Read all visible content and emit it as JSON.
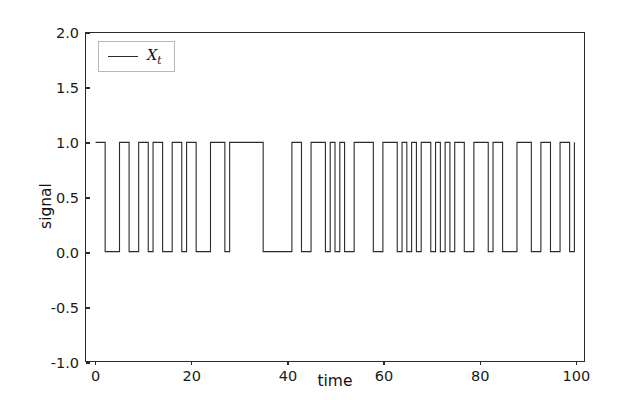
{
  "chart_data": {
    "type": "line",
    "title": "",
    "xlabel": "time",
    "ylabel": "signal",
    "xlim": [
      -2,
      102
    ],
    "ylim": [
      -1.0,
      2.0
    ],
    "grid": false,
    "legend_position": "upper left",
    "xticks": [
      0,
      20,
      40,
      60,
      80,
      100
    ],
    "xtick_labels": [
      "0",
      "20",
      "40",
      "60",
      "80",
      "100"
    ],
    "yticks": [
      -1.0,
      -0.5,
      0.0,
      0.5,
      1.0,
      1.5,
      2.0
    ],
    "ytick_labels": [
      "-1.0",
      "-0.5",
      "0.0",
      "0.5",
      "1.0",
      "1.5",
      "2.0"
    ],
    "series": [
      {
        "name": "X_t",
        "legend_label": "X",
        "legend_subscript": "t",
        "color": "#2b2b2b",
        "linewidth": 1.2,
        "drawstyle": "steps-post",
        "x": [
          0,
          1,
          2,
          3,
          4,
          5,
          6,
          7,
          8,
          9,
          10,
          11,
          12,
          13,
          14,
          15,
          16,
          17,
          18,
          19,
          20,
          21,
          22,
          23,
          24,
          25,
          26,
          27,
          28,
          29,
          30,
          31,
          32,
          33,
          34,
          35,
          36,
          37,
          38,
          39,
          40,
          41,
          42,
          43,
          44,
          45,
          46,
          47,
          48,
          49,
          50,
          51,
          52,
          53,
          54,
          55,
          56,
          57,
          58,
          59,
          60,
          61,
          62,
          63,
          64,
          65,
          66,
          67,
          68,
          69,
          70,
          71,
          72,
          73,
          74,
          75,
          76,
          77,
          78,
          79,
          80,
          81,
          82,
          83,
          84,
          85,
          86,
          87,
          88,
          89,
          90,
          91,
          92,
          93,
          94,
          95,
          96,
          97,
          98,
          99,
          100
        ],
        "values": [
          1,
          1,
          0,
          0,
          0,
          1,
          1,
          0,
          0,
          1,
          1,
          0,
          1,
          1,
          0,
          0,
          1,
          1,
          0,
          1,
          1,
          0,
          0,
          0,
          1,
          1,
          1,
          0,
          1,
          1,
          1,
          1,
          1,
          1,
          1,
          0,
          0,
          0,
          0,
          0,
          0,
          1,
          1,
          0,
          0,
          1,
          1,
          1,
          0,
          1,
          0,
          1,
          0,
          0,
          1,
          1,
          1,
          1,
          0,
          0,
          1,
          1,
          1,
          0,
          1,
          0,
          1,
          0,
          1,
          1,
          0,
          1,
          0,
          1,
          0,
          1,
          1,
          0,
          0,
          1,
          1,
          1,
          0,
          1,
          1,
          0,
          0,
          0,
          1,
          1,
          1,
          0,
          0,
          1,
          1,
          0,
          0,
          1,
          1,
          0,
          1
        ]
      }
    ]
  }
}
